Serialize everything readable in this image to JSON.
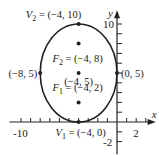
{
  "diagram": {
    "type": "ellipse-graph",
    "axes": {
      "x_label": "x",
      "y_label": "y",
      "x_tick_labels": [
        "-10",
        "2"
      ],
      "y_tick_labels": [
        "10",
        "-2"
      ],
      "x_range": [
        -11,
        3.5
      ],
      "y_range": [
        -3,
        11
      ]
    },
    "ellipse": {
      "center": [
        -4,
        5
      ],
      "semi_major": 5,
      "semi_minor": 4,
      "orientation": "vertical"
    },
    "points": [
      {
        "id": "V2",
        "x": -4,
        "y": 10,
        "name": "V",
        "sub": "2",
        "label": " = (−4, 10)"
      },
      {
        "id": "F2",
        "x": -4,
        "y": 8,
        "name": "F",
        "sub": "2",
        "label": " = (−4, 8)"
      },
      {
        "id": "C",
        "x": -4,
        "y": 5,
        "name": "",
        "sub": "",
        "label": "(−4, 5)"
      },
      {
        "id": "F1",
        "x": -4,
        "y": 2,
        "name": "F",
        "sub": "1",
        "label": " = (−4, 2)"
      },
      {
        "id": "V1",
        "x": -4,
        "y": 0,
        "name": "V",
        "sub": "1",
        "label": " = (−4, 0)"
      },
      {
        "id": "L",
        "x": -8,
        "y": 5,
        "name": "",
        "sub": "",
        "label": "(−8, 5)"
      },
      {
        "id": "R",
        "x": 0,
        "y": 5,
        "name": "",
        "sub": "",
        "label": "(0, 5)"
      }
    ]
  }
}
